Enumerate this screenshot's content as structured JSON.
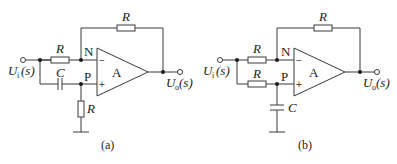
{
  "figures": [
    {
      "id": "a",
      "caption": "(a)",
      "opamp_label": "A",
      "input_label": "U",
      "input_sub": "i",
      "input_arg": "(s)",
      "output_label": "U",
      "output_sub": "o",
      "output_arg": "(s)",
      "node_n": "N",
      "node_p": "P",
      "minus_sign": "−",
      "plus_sign": "+",
      "feedback_resistor": "R",
      "input_resistor": "R",
      "series_capacitor": "C",
      "ground_resistor": "R"
    },
    {
      "id": "b",
      "caption": "(b)",
      "opamp_label": "A",
      "input_label": "U",
      "input_sub": "i",
      "input_arg": "(s)",
      "output_label": "U",
      "output_sub": "o",
      "output_arg": "(s)",
      "node_n": "N",
      "node_p": "P",
      "minus_sign": "−",
      "plus_sign": "+",
      "feedback_resistor": "R",
      "input_resistor": "R",
      "series_resistor": "R",
      "ground_capacitor": "C"
    }
  ]
}
